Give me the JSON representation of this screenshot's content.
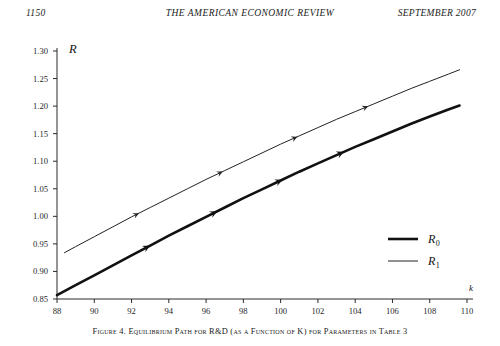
{
  "header": {
    "folio": "1150",
    "journal_title": "THE AMERICAN ECONOMIC REVIEW",
    "issue": "SEPTEMBER 2007"
  },
  "caption": "Figure 4. Equilibrium Path for R&D (as a Function of K) for Parameters in Table 3",
  "legend": {
    "position": "inside-right",
    "entries": [
      {
        "key": "R",
        "sub": "0",
        "style": "thick"
      },
      {
        "key": "R",
        "sub": "1",
        "style": "thin"
      }
    ]
  },
  "chart_data": {
    "type": "line",
    "title": "",
    "xlabel": "k",
    "ylabel": "R",
    "xlim": [
      88,
      110
    ],
    "ylim": [
      0.85,
      1.3
    ],
    "xticks": [
      88,
      90,
      92,
      94,
      96,
      98,
      100,
      102,
      104,
      106,
      108,
      110
    ],
    "xtick_labels": [
      "88",
      "90",
      "92",
      "94",
      "96",
      "98",
      "100",
      "102",
      "104",
      "106",
      "108",
      "110"
    ],
    "yticks": [
      0.85,
      0.9,
      0.95,
      1.0,
      1.05,
      1.1,
      1.15,
      1.2,
      1.25,
      1.3
    ],
    "ytick_labels": [
      "0.85",
      "0.90",
      "0.95",
      "1.00",
      "1.05",
      "1.10",
      "1.15",
      "1.20",
      "1.25",
      "1.30"
    ],
    "grid": false,
    "legend_position": "inside-right",
    "series": [
      {
        "name": "R0",
        "label": "R_0",
        "style": "thick",
        "color": "#111111",
        "width": 2.6,
        "x": [
          88.0,
          89.0,
          90.0,
          91.0,
          92.0,
          93.0,
          94.0,
          95.0,
          96.0,
          97.0,
          98.0,
          99.0,
          100.0,
          101.0,
          102.0,
          103.0,
          104.0,
          105.0,
          106.0,
          107.0,
          108.0,
          109.0,
          109.6
        ],
        "y": [
          0.857,
          0.875,
          0.893,
          0.911,
          0.929,
          0.947,
          0.965,
          0.982,
          0.999,
          1.016,
          1.033,
          1.049,
          1.065,
          1.081,
          1.096,
          1.111,
          1.126,
          1.14,
          1.154,
          1.168,
          1.181,
          1.194,
          1.201
        ],
        "arrows": [
          {
            "x": 93.0,
            "direction": "right"
          },
          {
            "x": 96.6,
            "direction": "right"
          },
          {
            "x": 100.1,
            "direction": "right"
          },
          {
            "x": 103.4,
            "direction": "right"
          }
        ]
      },
      {
        "name": "R1",
        "label": "R_1",
        "style": "thin",
        "color": "#222222",
        "width": 1.0,
        "x": [
          88.4,
          89.0,
          90.0,
          91.0,
          92.0,
          93.0,
          94.0,
          95.0,
          96.0,
          97.0,
          98.0,
          99.0,
          100.0,
          101.0,
          102.0,
          103.0,
          104.0,
          105.0,
          106.0,
          107.0,
          108.0,
          109.0,
          109.6
        ],
        "y": [
          0.934,
          0.945,
          0.963,
          0.981,
          0.999,
          1.016,
          1.033,
          1.05,
          1.067,
          1.083,
          1.099,
          1.115,
          1.131,
          1.146,
          1.161,
          1.176,
          1.19,
          1.204,
          1.218,
          1.232,
          1.245,
          1.258,
          1.266
        ],
        "arrows": [
          {
            "x": 92.4,
            "direction": "right"
          },
          {
            "x": 96.9,
            "direction": "right"
          },
          {
            "x": 100.9,
            "direction": "right"
          },
          {
            "x": 104.7,
            "direction": "right"
          }
        ]
      }
    ]
  }
}
